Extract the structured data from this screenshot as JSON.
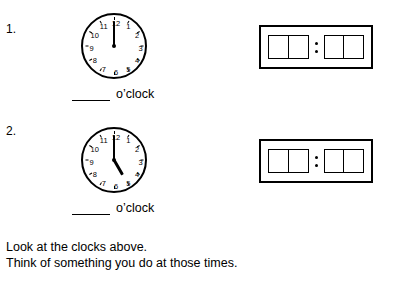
{
  "worksheet": {
    "items": [
      {
        "number": "1.",
        "clock": {
          "name": "analog-clock-1",
          "hour_value": 12,
          "minute_value": 0,
          "hour_angle_deg": 0,
          "minute_angle_deg": 0,
          "numerals": [
            "12",
            "1",
            "2",
            "3",
            "4",
            "5",
            "6",
            "7",
            "8",
            "9",
            "10",
            "11"
          ]
        },
        "answer": {
          "blank_label": "",
          "oclock_label": "o’clock"
        },
        "digital": {
          "name": "digital-clock-1",
          "left_digits": [
            "",
            ""
          ],
          "right_digits": [
            "",
            ""
          ],
          "separator": ":"
        }
      },
      {
        "number": "2.",
        "clock": {
          "name": "analog-clock-2",
          "hour_value": 5,
          "minute_value": 0,
          "hour_angle_deg": 150,
          "minute_angle_deg": 0,
          "numerals": [
            "12",
            "1",
            "2",
            "3",
            "4",
            "5",
            "6",
            "7",
            "8",
            "9",
            "10",
            "11"
          ]
        },
        "answer": {
          "blank_label": "",
          "oclock_label": "o’clock"
        },
        "digital": {
          "name": "digital-clock-2",
          "left_digits": [
            "",
            ""
          ],
          "right_digits": [
            "",
            ""
          ],
          "separator": ":"
        }
      }
    ],
    "instructions": {
      "line1": "Look at the clocks above.",
      "line2": "Think of something you do at those times."
    }
  }
}
